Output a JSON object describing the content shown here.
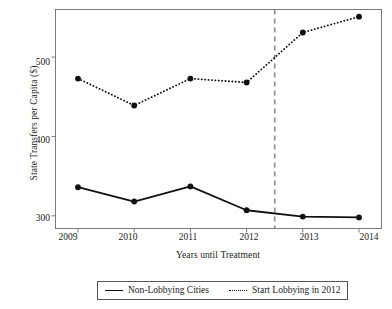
{
  "chart_data": {
    "type": "line",
    "title": "",
    "xlabel": "Years until Treatment",
    "ylabel": "State Transfers per Capita ($)",
    "categories": [
      "2009",
      "2010",
      "2011",
      "2012",
      "2013",
      "2014"
    ],
    "x": [
      2009,
      2010,
      2011,
      2012,
      2013,
      2014
    ],
    "xlim": [
      2008.6,
      2014.4
    ],
    "ylim": [
      284,
      560
    ],
    "yticks": [
      300,
      400,
      500
    ],
    "ytick_labels": [
      "300",
      "400",
      "500"
    ],
    "xtick_labels": [
      "2009",
      "2010",
      "2011",
      "2012",
      "2013",
      "2014"
    ],
    "grid": false,
    "legend_position": "below-axes",
    "series": [
      {
        "name": "Non-Lobbying Cities",
        "style": "solid",
        "marker": "filled-circle",
        "color": "#111111",
        "values": [
          336,
          318,
          337,
          307,
          299,
          298
        ]
      },
      {
        "name": "Start Lobbying in 2012",
        "style": "dotted",
        "marker": "filled-circle",
        "color": "#111111",
        "values": [
          473,
          439,
          473,
          468,
          531,
          551
        ]
      }
    ],
    "annotations": [
      {
        "type": "vertical-dashed-line",
        "x": 2012.5,
        "color": "#8a8a8a",
        "label": ""
      }
    ]
  },
  "legend": {
    "entries": [
      {
        "label": "Non-Lobbying Cities",
        "marker": "solid-line-swatch"
      },
      {
        "label": "Start Lobbying in 2012",
        "marker": "dotted-line-swatch"
      }
    ]
  }
}
